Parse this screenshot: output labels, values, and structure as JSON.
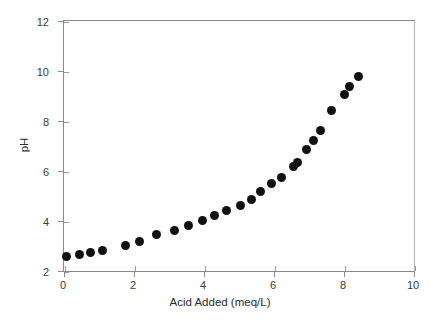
{
  "chart_data": {
    "type": "scatter",
    "title": "",
    "xlabel": "Acid Added (meq/L)",
    "ylabel": "pH",
    "xlim": [
      0,
      10
    ],
    "ylim": [
      2,
      12
    ],
    "xticks": [
      0,
      2,
      4,
      6,
      8,
      10
    ],
    "yticks": [
      2,
      4,
      6,
      8,
      10,
      12
    ],
    "xtick_labels": [
      "0",
      "2",
      "4",
      "6",
      "8",
      "10"
    ],
    "ytick_labels": [
      "2",
      "4",
      "6",
      "8",
      "10",
      "12"
    ],
    "grid": false,
    "legend": false,
    "legend_position": "none",
    "marker": "filled-circle",
    "marker_color": "#111111",
    "marker_size_px": 9,
    "series": [
      {
        "name": "Titration curve",
        "points": [
          {
            "x": 0.07,
            "y": 2.6
          },
          {
            "x": 0.45,
            "y": 2.66
          },
          {
            "x": 0.75,
            "y": 2.76
          },
          {
            "x": 1.1,
            "y": 2.84
          },
          {
            "x": 1.75,
            "y": 3.02
          },
          {
            "x": 2.15,
            "y": 3.18
          },
          {
            "x": 2.65,
            "y": 3.45
          },
          {
            "x": 3.15,
            "y": 3.62
          },
          {
            "x": 3.55,
            "y": 3.84
          },
          {
            "x": 3.95,
            "y": 4.03
          },
          {
            "x": 4.3,
            "y": 4.24
          },
          {
            "x": 4.65,
            "y": 4.44
          },
          {
            "x": 5.05,
            "y": 4.63
          },
          {
            "x": 5.35,
            "y": 4.87
          },
          {
            "x": 5.62,
            "y": 5.2
          },
          {
            "x": 5.92,
            "y": 5.5
          },
          {
            "x": 6.2,
            "y": 5.75
          },
          {
            "x": 6.55,
            "y": 6.18
          },
          {
            "x": 6.68,
            "y": 6.36
          },
          {
            "x": 6.92,
            "y": 6.85
          },
          {
            "x": 7.12,
            "y": 7.22
          },
          {
            "x": 7.32,
            "y": 7.64
          },
          {
            "x": 7.65,
            "y": 8.44
          },
          {
            "x": 8.0,
            "y": 9.07
          },
          {
            "x": 8.15,
            "y": 9.4
          },
          {
            "x": 8.42,
            "y": 9.8
          }
        ]
      }
    ]
  },
  "axes": {
    "y_axis_label": "pH",
    "x_axis_label": "Acid Added (meq/L)"
  },
  "colors": {
    "marker": "#111111",
    "axis": "#8a8a8a",
    "tick_text": "#3a3a3a",
    "label_text": "#2b2b2b",
    "background": "#ffffff"
  }
}
